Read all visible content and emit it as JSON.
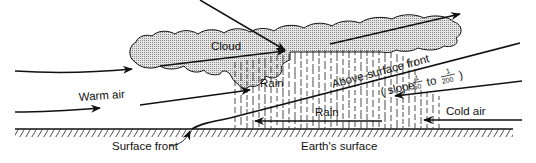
{
  "diagram": {
    "type": "warm-front-cross-section",
    "labels": {
      "cloud": "Cloud",
      "warm_air": "Warm air",
      "rain_upper": "Rain",
      "rain_lower": "Rain",
      "above_surface_front": "Above-surface front",
      "slope_prefix": "( slope",
      "slope_frac1_num": "1",
      "slope_frac1_den": "50",
      "slope_to": "to",
      "slope_frac2_num": "1",
      "slope_frac2_den": "200",
      "slope_suffix": ")",
      "cold_air": "Cold air",
      "surface_front": "Surface front",
      "earths_surface": "Earth's surface"
    },
    "colors": {
      "ink": "#111111",
      "cloud_fill": "#c8c8c8",
      "background": "#ffffff"
    }
  }
}
